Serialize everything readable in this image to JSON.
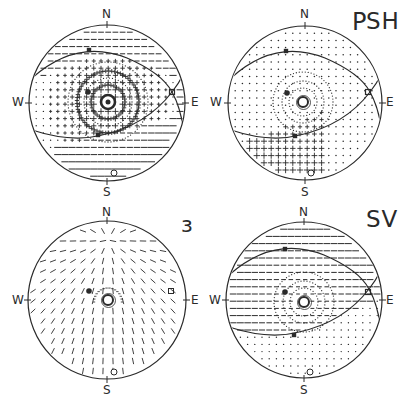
{
  "figure": {
    "type": "stereonet-radiation-patterns",
    "colors": {
      "ink": "#2a2a2a",
      "background": "#ffffff"
    },
    "panels": [
      {
        "id": "P",
        "label": "P",
        "label_pos": [
          353,
          12
        ],
        "center": [
          107,
          103
        ],
        "radius": 78,
        "compass": {
          "N": "N",
          "S": "S",
          "W": "W",
          "E": "E"
        },
        "pattern": "P",
        "great_circles": true,
        "markers": {
          "filled_dot": [
            88,
            92
          ],
          "bullseye": [
            108,
            102
          ],
          "open_circle": [
            114,
            173
          ],
          "upper_square": [
            89,
            50
          ],
          "lower_square": [
            98,
            135
          ],
          "cross": [
            172,
            92
          ]
        }
      },
      {
        "id": "SH",
        "label": "SH",
        "label_pos": [
          369,
          12
        ],
        "center": [
          305,
          103
        ],
        "radius": 77,
        "compass": {
          "N": "N",
          "S": "S",
          "W": "W",
          "E": "E"
        },
        "pattern": "SH",
        "great_circles": true,
        "markers": {
          "filled_dot": [
            287,
            93
          ],
          "bullseye": [
            303,
            102
          ],
          "open_circle": [
            311,
            173
          ],
          "upper_square": [
            286,
            51
          ],
          "lower_square": [
            295,
            136
          ],
          "cross": [
            368,
            92
          ]
        }
      },
      {
        "id": "epsilon",
        "label": "ɜ",
        "label_pos": [
          181,
          218
        ],
        "center": [
          107,
          300
        ],
        "radius": 79,
        "compass": {
          "N": "N",
          "S": "S",
          "W": "W",
          "E": "E"
        },
        "pattern": "epsilon",
        "great_circles": false,
        "markers": {
          "filled_dot": [
            89,
            291
          ],
          "bullseye": [
            108,
            300
          ],
          "open_circle": [
            114,
            372
          ],
          "open_square": [
            171,
            291
          ]
        }
      },
      {
        "id": "SV",
        "label": "SV",
        "label_pos": [
          369,
          210
        ],
        "center": [
          304,
          300
        ],
        "radius": 78,
        "compass": {
          "N": "N",
          "S": "S",
          "W": "W",
          "E": "E"
        },
        "pattern": "SV",
        "great_circles": true,
        "markers": {
          "filled_dot": [
            285,
            292
          ],
          "bullseye": [
            304,
            302
          ],
          "open_circle": [
            310,
            372
          ],
          "upper_square": [
            285,
            249
          ],
          "lower_square": [
            294,
            335
          ],
          "cross": [
            368,
            292
          ]
        }
      }
    ]
  }
}
